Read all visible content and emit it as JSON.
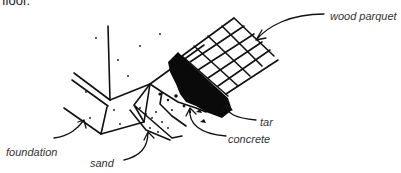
{
  "caption": {
    "fragment": "floor."
  },
  "diagram": {
    "type": "floor-construction-cross-section",
    "labels": [
      {
        "id": "wood-parquet",
        "text": "wood parquet"
      },
      {
        "id": "tar",
        "text": "tar"
      },
      {
        "id": "concrete",
        "text": "concrete"
      },
      {
        "id": "foundation",
        "text": "foundation"
      },
      {
        "id": "sand",
        "text": "sand"
      }
    ]
  }
}
